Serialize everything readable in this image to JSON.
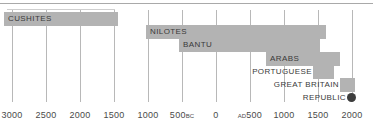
{
  "chart_data": {
    "type": "bar",
    "title": "",
    "subtitle": "",
    "xlabel": "",
    "ylabel": "",
    "orientation": "horizontal",
    "grid": true,
    "legend": null,
    "xaxis": {
      "unit": "years",
      "range_bc_ad": "3000 BC to AD 2000",
      "ticks": [
        {
          "label": "3000",
          "era": "",
          "x": 12,
          "year": -3000
        },
        {
          "label": "2500",
          "era": "",
          "x": 46,
          "year": -2500
        },
        {
          "label": "2000",
          "era": "",
          "x": 80,
          "year": -2000
        },
        {
          "label": "1500",
          "era": "",
          "x": 114,
          "year": -1500
        },
        {
          "label": "1000",
          "era": "",
          "x": 148,
          "year": -1000
        },
        {
          "label": "500",
          "era": "BC",
          "x": 182,
          "year": -500
        },
        {
          "label": "0",
          "era": "",
          "x": 216,
          "year": 0
        },
        {
          "label": "500",
          "era": "AD",
          "era_position": "before",
          "x": 250,
          "year": 500
        },
        {
          "label": "1000",
          "era": "",
          "x": 284,
          "year": 1000
        },
        {
          "label": "1500",
          "era": "",
          "x": 318,
          "year": 1500
        },
        {
          "label": "2000",
          "era": "",
          "x": 352,
          "year": 2000
        }
      ]
    },
    "categories": [
      "CUSHITES",
      "NILOTES",
      "BANTU",
      "ARABS",
      "PORTUGUESE",
      "GREAT BRITAIN",
      "REPUBLIC"
    ],
    "series": [
      {
        "name": "Presence in region",
        "bars": [
          {
            "label": "CUSHITES",
            "start_year": -3200,
            "end_year": -1400,
            "x": 4,
            "width": 114,
            "row": 0,
            "label_position": "inside"
          },
          {
            "label": "NILOTES",
            "start_year": -1100,
            "end_year": 1450,
            "x": 146,
            "width": 180,
            "row": 1,
            "label_position": "inside"
          },
          {
            "label": "BANTU",
            "start_year": -620,
            "end_year": 1430,
            "x": 179,
            "width": 141,
            "row": 2,
            "label_position": "inside"
          },
          {
            "label": "ARABS",
            "start_year": 740,
            "end_year": 1820,
            "x": 266,
            "width": 74,
            "row": 3,
            "label_position": "inside"
          },
          {
            "label": "PORTUGUESE",
            "start_year": 1430,
            "end_year": 1740,
            "x": 313,
            "width": 21,
            "row": 4,
            "label_position": "outside"
          },
          {
            "label": "GREAT BRITAIN",
            "start_year": 1830,
            "end_year": 1970,
            "x": 340,
            "width": 15,
            "row": 5,
            "label_position": "outside"
          },
          {
            "label": "REPUBLIC",
            "start_year": 1990,
            "end_year": 2000,
            "x": 347,
            "width": 9,
            "row": 6,
            "label_position": "outside",
            "marker": "dot"
          }
        ]
      }
    ],
    "colors": {
      "bar_fill": "#b3b3b3",
      "gridline": "#b8b8b8",
      "label_text": "#3a3a3a",
      "tick_text": "#4a4a4a",
      "rule": "#a9a9a9",
      "dot": "#3d3d3d",
      "background": "#ffffff"
    }
  }
}
